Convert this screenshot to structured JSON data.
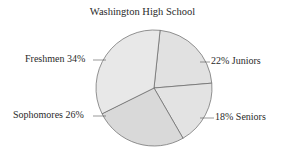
{
  "chart_data": {
    "type": "pie",
    "title": "Washington High School",
    "categories": [
      "Juniors",
      "Seniors",
      "Sophomores",
      "Freshmen"
    ],
    "values": [
      22,
      18,
      26,
      34
    ],
    "labels": [
      "22%",
      "18%",
      "26%",
      "34%"
    ],
    "colors": [
      "#e1e1e1",
      "#e3e3e3",
      "#d9d9d9",
      "#e8e8e8"
    ],
    "unit": "%",
    "legend": "none (inline labels with leader lines)"
  },
  "labels": {
    "freshmen": "Freshmen  34%",
    "sophomores": "Sophomores  26%",
    "juniors": "22%  Juniors",
    "seniors": "18%  Seniors"
  }
}
